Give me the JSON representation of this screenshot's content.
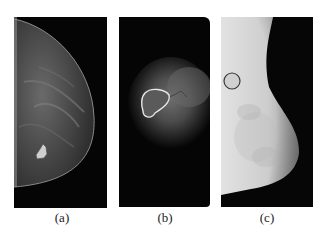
{
  "figure": {
    "panels": [
      {
        "id": "a",
        "label": "(a)",
        "description": "Mammogram (cranio-caudal view) with a small contoured bright lesion"
      },
      {
        "id": "b",
        "label": "(b)",
        "description": "Cropped mammogram region with a white outlined mass contour"
      },
      {
        "id": "c",
        "label": "(c)",
        "description": "Mammogram (medio-lateral view) with a circled region"
      }
    ]
  },
  "colors": {
    "background": "#ffffff",
    "image_dark": "#050505",
    "outline_b": "#e8e8e8",
    "circle_c": "#3a3a3a"
  }
}
